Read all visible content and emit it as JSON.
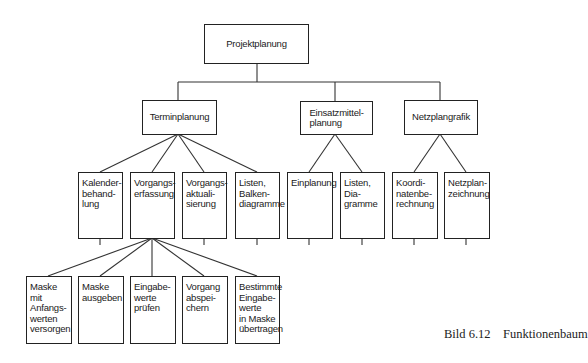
{
  "diagram": {
    "type": "function-tree",
    "root": {
      "label": "Projektplanung"
    },
    "level2": [
      {
        "label": "Terminplanung"
      },
      {
        "label": "Einsatzmittel-\nplanung"
      },
      {
        "label": "Netzplangrafik"
      }
    ],
    "level3": [
      {
        "label": "Kalender-\nbehand-\nlung",
        "parent": "Terminplanung"
      },
      {
        "label": "Vorgangs-\nerfassung",
        "parent": "Terminplanung"
      },
      {
        "label": "Vorgangs-\naktuali-\nsierung",
        "parent": "Terminplanung"
      },
      {
        "label": "Listen,\nBalken-\ndiagramme",
        "parent": "Terminplanung"
      },
      {
        "label": "Einplanung",
        "parent": "Einsatzmittelplanung"
      },
      {
        "label": "Listen, Dia-\ngramme",
        "parent": "Einsatzmittelplanung"
      },
      {
        "label": "Koordi-\nnatenbe-\nrechnung",
        "parent": "Netzplangrafik"
      },
      {
        "label": "Netzplan-\nzeichnung",
        "parent": "Netzplangrafik"
      }
    ],
    "level4": [
      {
        "label": "Maske mit\nAnfangs-\nwerten\nversorgen",
        "parent": "Vorgangserfassung"
      },
      {
        "label": "Maske\nausgeben",
        "parent": "Vorgangserfassung"
      },
      {
        "label": "Eingabe-\nwerte\nprüfen",
        "parent": "Vorgangserfassung"
      },
      {
        "label": "Vorgang\nabspei-\nchern",
        "parent": "Vorgangserfassung"
      },
      {
        "label": "Bestimmte\nEingabe-\nwerte\nin Maske\nübertragen",
        "parent": "Vorgangserfassung"
      }
    ]
  },
  "caption": "Bild 6.12    Funktionenbaum"
}
